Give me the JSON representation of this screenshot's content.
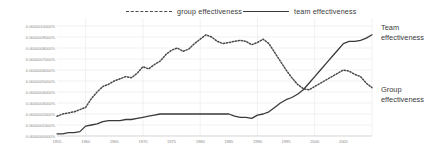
{
  "legend": {
    "items": [
      {
        "key": "group",
        "label": "group effectiveness",
        "style": "dashed",
        "color": "#4a4a4a"
      },
      {
        "key": "team",
        "label": "team effectiveness",
        "style": "solid",
        "color": "#3a3a3a"
      }
    ]
  },
  "annotations": {
    "team_line1": "Team",
    "team_line2": "effectiveness",
    "group_line1": "Group",
    "group_line2": "effectiveness"
  },
  "chart_data": {
    "type": "line",
    "title": "",
    "xlabel": "",
    "ylabel": "",
    "grid": true,
    "legend_position": "top",
    "ylim": [
      0.0,
      1e-06
    ],
    "ytick_labels": [
      "0.0000010000%",
      "0.0000009000%",
      "0.0000008000%",
      "0.0000007000%",
      "0.0000006000%",
      "0.0000005000%",
      "0.0000004000%",
      "0.0000003000%",
      "0.0000002000%",
      "0.0000001000%",
      "0.0000000000%"
    ],
    "ytick_values": [
      1e-06,
      9e-07,
      8e-07,
      7e-07,
      6e-07,
      5e-07,
      4e-07,
      3e-07,
      2e-07,
      1e-07,
      0.0
    ],
    "xlim": [
      1955,
      2010
    ],
    "xtick_labels": [
      "1955",
      "1960",
      "1965",
      "1970",
      "1975",
      "1980",
      "1985",
      "1990",
      "1995",
      "2000",
      "2005"
    ],
    "xtick_values": [
      1955,
      1960,
      1965,
      1970,
      1975,
      1980,
      1985,
      1990,
      1995,
      2000,
      2005
    ],
    "gridlines_x": [
      1960,
      1970,
      1980,
      1990,
      2000,
      2010
    ],
    "series": [
      {
        "name": "group effectiveness",
        "style": "dashed",
        "color": "#4a4a4a",
        "x": [
          1955,
          1956,
          1957,
          1958,
          1959,
          1960,
          1961,
          1962,
          1963,
          1964,
          1965,
          1966,
          1967,
          1968,
          1969,
          1970,
          1971,
          1972,
          1973,
          1974,
          1975,
          1976,
          1977,
          1978,
          1979,
          1980,
          1981,
          1982,
          1983,
          1984,
          1985,
          1986,
          1987,
          1988,
          1989,
          1990,
          1991,
          1992,
          1993,
          1994,
          1995,
          1996,
          1997,
          1998,
          1999,
          2000,
          2001,
          2002,
          2003,
          2004,
          2005,
          2006,
          2007,
          2008,
          2009,
          2010
        ],
        "values": [
          1.8e-07,
          2e-07,
          2.1e-07,
          2.2e-07,
          2.4e-07,
          2.6e-07,
          3.4e-07,
          4e-07,
          4.5e-07,
          4.7e-07,
          5e-07,
          5.2e-07,
          5.4e-07,
          5.3e-07,
          5.7e-07,
          6.3e-07,
          6.1e-07,
          6.5e-07,
          6.8e-07,
          7.4e-07,
          7.8e-07,
          8e-07,
          7.7e-07,
          7.9e-07,
          8.4e-07,
          8.8e-07,
          9.2e-07,
          9e-07,
          8.6e-07,
          8.4e-07,
          8.5e-07,
          8.6e-07,
          8.7e-07,
          8.6e-07,
          8.3e-07,
          8.5e-07,
          8.8e-07,
          8.4e-07,
          7.6e-07,
          6.8e-07,
          6e-07,
          5.3e-07,
          4.7e-07,
          4.3e-07,
          4.2e-07,
          4.5e-07,
          4.8e-07,
          5.1e-07,
          5.4e-07,
          5.7e-07,
          6e-07,
          5.9e-07,
          5.6e-07,
          5.4e-07,
          4.8e-07,
          4.4e-07
        ]
      },
      {
        "name": "team effectiveness",
        "style": "solid",
        "color": "#3a3a3a",
        "x": [
          1955,
          1956,
          1957,
          1958,
          1959,
          1960,
          1961,
          1962,
          1963,
          1964,
          1965,
          1966,
          1967,
          1968,
          1969,
          1970,
          1971,
          1972,
          1973,
          1974,
          1975,
          1976,
          1977,
          1978,
          1979,
          1980,
          1981,
          1982,
          1983,
          1984,
          1985,
          1986,
          1987,
          1988,
          1989,
          1990,
          1991,
          1992,
          1993,
          1994,
          1995,
          1996,
          1997,
          1998,
          1999,
          2000,
          2001,
          2002,
          2003,
          2004,
          2005,
          2006,
          2007,
          2008,
          2009,
          2010
        ],
        "values": [
          2e-08,
          2e-08,
          3e-08,
          3e-08,
          4e-08,
          9e-08,
          1e-07,
          1.1e-07,
          1.3e-07,
          1.4e-07,
          1.4e-07,
          1.4e-07,
          1.5e-07,
          1.5e-07,
          1.6e-07,
          1.7e-07,
          1.8e-07,
          1.9e-07,
          2e-07,
          2e-07,
          2e-07,
          2e-07,
          2e-07,
          2e-07,
          2e-07,
          2e-07,
          2e-07,
          2e-07,
          2e-07,
          2e-07,
          2e-07,
          1.8e-07,
          1.7e-07,
          1.7e-07,
          1.6e-07,
          1.9e-07,
          2e-07,
          2.2e-07,
          2.6e-07,
          3e-07,
          3.3e-07,
          3.5e-07,
          3.8e-07,
          4.2e-07,
          4.8e-07,
          5.4e-07,
          6e-07,
          6.6e-07,
          7.2e-07,
          7.8e-07,
          8.4e-07,
          8.6e-07,
          8.6e-07,
          8.7e-07,
          8.9e-07,
          9.2e-07
        ]
      }
    ]
  }
}
